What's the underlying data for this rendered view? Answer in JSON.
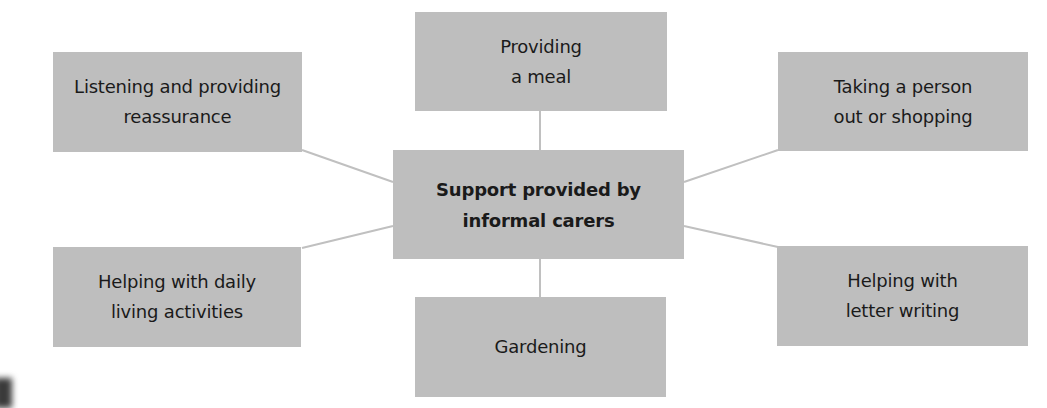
{
  "diagram": {
    "type": "mind-map",
    "colors": {
      "box_fill": "#bebebe",
      "connector": "#c0c0c0",
      "text": "#1a1a1a",
      "background": "#ffffff"
    },
    "center": {
      "label": "Support provided by\ninformal carers"
    },
    "nodes": [
      {
        "id": "top",
        "label": "Providing\na meal"
      },
      {
        "id": "top-left",
        "label": "Listening and providing\nreassurance"
      },
      {
        "id": "top-right",
        "label": "Taking a person\nout or shopping"
      },
      {
        "id": "bottom-left",
        "label": "Helping with daily\nliving activities"
      },
      {
        "id": "bottom",
        "label": "Gardening"
      },
      {
        "id": "bottom-right",
        "label": "Helping with\nletter writing"
      }
    ]
  }
}
